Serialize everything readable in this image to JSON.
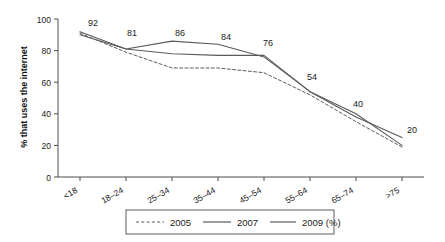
{
  "chart_data": {
    "type": "line",
    "title": "",
    "xlabel": "",
    "ylabel": "% that uses the internet",
    "categories": [
      "<18",
      "18–24",
      "25–34",
      "35–44",
      "45–54",
      "55–64",
      "65–74",
      ">75"
    ],
    "ylim": [
      0,
      100
    ],
    "yticks": [
      0,
      20,
      40,
      60,
      80,
      100
    ],
    "ytick_labels": [
      "0",
      "20",
      "40",
      "60",
      "80",
      "100"
    ],
    "grid": false,
    "legend_position": "bottom",
    "series": [
      {
        "name": "2005",
        "style": "dashed",
        "values": [
          91,
          79,
          69,
          69,
          66,
          52,
          35,
          19
        ]
      },
      {
        "name": "2007",
        "style": "solid",
        "values": [
          90,
          81,
          78,
          77,
          77,
          54,
          38,
          25
        ]
      },
      {
        "name": "2009 (%)",
        "style": "solid",
        "values": [
          92,
          81,
          86,
          84,
          76,
          54,
          40,
          20
        ]
      }
    ],
    "data_labels": [
      {
        "text": "92",
        "category": "<18",
        "value": 92
      },
      {
        "text": "81",
        "category": "18–24",
        "value": 81
      },
      {
        "text": "86",
        "category": "25–34",
        "value": 86
      },
      {
        "text": "84",
        "category": "35–44",
        "value": 84
      },
      {
        "text": "76",
        "category": "45–54",
        "value": 76
      },
      {
        "text": "54",
        "category": "55–64",
        "value": 54
      },
      {
        "text": "40",
        "category": "65–74",
        "value": 40
      },
      {
        "text": "20",
        "category": ">75",
        "value": 20
      }
    ],
    "legend_entries": [
      "2005",
      "2007",
      "2009 (%)"
    ],
    "colors": {
      "line": "#5a5a5a",
      "axis": "#3a3a3a",
      "text": "#1a1a1a",
      "background": "#ffffff"
    }
  }
}
